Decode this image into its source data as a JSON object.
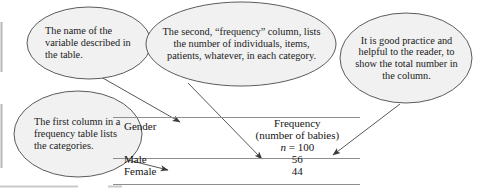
{
  "figure": {
    "kind": "annotated-frequency-table-diagram",
    "callouts": [
      {
        "id": "variable-name",
        "text": "The name of the variable described in the table."
      },
      {
        "id": "frequency-column",
        "text": "The second, “frequency” column, lists the number of individuals, items, patients, whatever, in each category."
      },
      {
        "id": "total-practice",
        "text": "It is good practice and helpful to the reader, to show the total number in the column."
      },
      {
        "id": "first-column",
        "text": "The first column in a frequency table lists the categories."
      }
    ],
    "table": {
      "headers": {
        "category": "Gender",
        "frequency_line1": "Frequency",
        "frequency_line2": "(number of babies)",
        "total_symbol": "n",
        "total_equals": " = ",
        "total_value": "100"
      },
      "rows": [
        {
          "category": "Male",
          "frequency": "56"
        },
        {
          "category": "Female",
          "frequency": "44"
        }
      ]
    },
    "colors": {
      "ellipse_fill": "#f1f1f1",
      "ellipse_stroke": "#4a4a4a",
      "rule": "#8e8e8e",
      "arrow": "#3a3a3a",
      "text": "#141414",
      "frame": "#b8b8b8"
    }
  }
}
